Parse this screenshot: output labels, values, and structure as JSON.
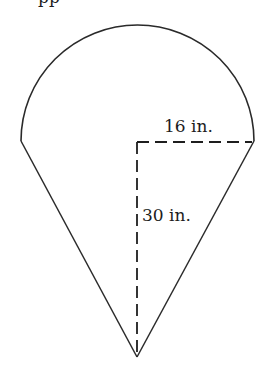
{
  "figure": {
    "shapes": {
      "semicircle": {
        "radius_label": "16 in.",
        "radius_value": 16,
        "unit": "in."
      },
      "triangle": {
        "height_label": "30 in.",
        "height_value": 30,
        "unit": "in."
      }
    },
    "labels": {
      "radius": "16 in.",
      "height": "30 in."
    },
    "top_cropped_text": "pp",
    "colors": {
      "stroke": "#2a2a2a",
      "background": "#ffffff",
      "text": "#1c1c1c"
    }
  }
}
